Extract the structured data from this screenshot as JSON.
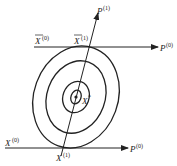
{
  "diagram": {
    "type": "optimization-contour-conjugate-directions",
    "colors": {
      "stroke": "#222222",
      "background": "#ffffff"
    },
    "labels": {
      "p1": {
        "base": "P",
        "sup": "(1)"
      },
      "p0_top": {
        "base": "P",
        "sup": "(0)"
      },
      "p0_bottom": {
        "base": "P",
        "sup": "(0)"
      },
      "xbar0": {
        "base": "X",
        "sup": "(0)",
        "overline": true
      },
      "xbar1": {
        "base": "X",
        "sup": "(1)",
        "overline": true
      },
      "x0": {
        "base": "X",
        "sup": "(0)"
      },
      "x1": {
        "base": "X",
        "sup": "(1)"
      },
      "xstar": {
        "base": "X",
        "sup": "*"
      }
    },
    "contours": 4,
    "lines": [
      {
        "name": "top-direction-p0",
        "label": "P(0)"
      },
      {
        "name": "bottom-direction-p0",
        "label": "P(0)"
      },
      {
        "name": "conjugate-direction-p1",
        "label": "P(1)"
      }
    ]
  }
}
